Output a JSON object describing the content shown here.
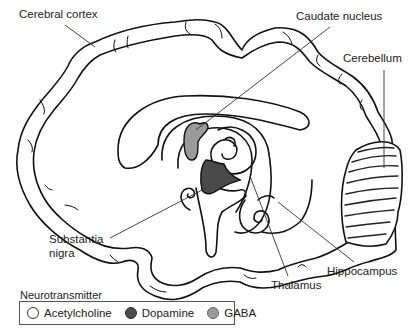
{
  "figure": {
    "type": "brain sagittal section diagram",
    "labels": {
      "cerebral_cortex": "Cerebral cortex",
      "caudate_nucleus": "Caudate nucleus",
      "cerebellum": "Cerebellum",
      "substantia_nigra_line1": "Substantia",
      "substantia_nigra_line2": "nigra",
      "thalamus": "Thalamus",
      "hippocampus": "Hippocampus"
    }
  },
  "legend": {
    "title": "Neurotransmitter",
    "items": [
      {
        "label": "Acetylcholine",
        "color": "#ffffff"
      },
      {
        "label": "Dopamine",
        "color": "#4a4a4a"
      },
      {
        "label": "GABA",
        "color": "#9a9a9a"
      }
    ]
  },
  "colors": {
    "outline": "#111111",
    "dopamine_fill": "#4a4a4a",
    "gaba_fill": "#9a9a9a",
    "leader_line": "#333333"
  }
}
